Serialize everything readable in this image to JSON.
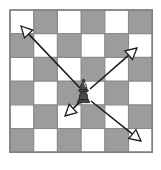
{
  "diagram": {
    "title": "Bishop diagonal movement on a checkered board",
    "kind": "chess-move-diagram",
    "canvas": {
      "width": 161,
      "height": 170,
      "background": "#ffffff"
    }
  },
  "board": {
    "name": "checkerboard",
    "columns": 6,
    "rows": 6,
    "origin_x": 10,
    "origin_y": 10,
    "cell_size": 23.7,
    "light_color": "#ffffff",
    "dark_color": "#9c9c9c",
    "grid_line_color": "#8a8a8a",
    "grid_line_width": 1.2,
    "border_color": "#808080",
    "border_width": 1.6,
    "pattern_note": "row 0 col 0 is light; square is dark when (row + col) is odd",
    "squares": [
      [
        "light",
        "dark",
        "light",
        "dark",
        "light",
        "dark"
      ],
      [
        "dark",
        "light",
        "dark",
        "light",
        "dark",
        "light"
      ],
      [
        "light",
        "dark",
        "light",
        "dark",
        "light",
        "dark"
      ],
      [
        "dark",
        "light",
        "dark",
        "light",
        "dark",
        "light"
      ],
      [
        "light",
        "dark",
        "light",
        "dark",
        "light",
        "dark"
      ],
      [
        "dark",
        "light",
        "dark",
        "light",
        "dark",
        "light"
      ]
    ]
  },
  "piece": {
    "name": "bishop",
    "label": "Bishop",
    "color": "dark",
    "fill": "#4a4a4a",
    "outline": "#1e1e1e",
    "row": 3,
    "col": 3,
    "center_x": 83.5,
    "center_y": 94,
    "on_square": "light"
  },
  "arrows": {
    "color": "#1c1c1c",
    "line_width": 1.6,
    "head_style": "open-outline-triangle",
    "head_fill": "#ffffff",
    "head_size": 11,
    "items": [
      {
        "name": "arrow-up-left",
        "direction": "up-left",
        "from_x": 80.0,
        "from_y": 88.0,
        "to_x": 21.0,
        "to_y": 26.0
      },
      {
        "name": "arrow-up-right",
        "direction": "up-right",
        "from_x": 90.0,
        "from_y": 89.0,
        "to_x": 137.0,
        "to_y": 48.0
      },
      {
        "name": "arrow-down-left",
        "direction": "down-left",
        "from_x": 80.0,
        "from_y": 102.0,
        "to_x": 65.0,
        "to_y": 116.0
      },
      {
        "name": "arrow-down-right",
        "direction": "down-right",
        "from_x": 91.0,
        "from_y": 101.0,
        "to_x": 141.0,
        "to_y": 141.0
      }
    ]
  }
}
